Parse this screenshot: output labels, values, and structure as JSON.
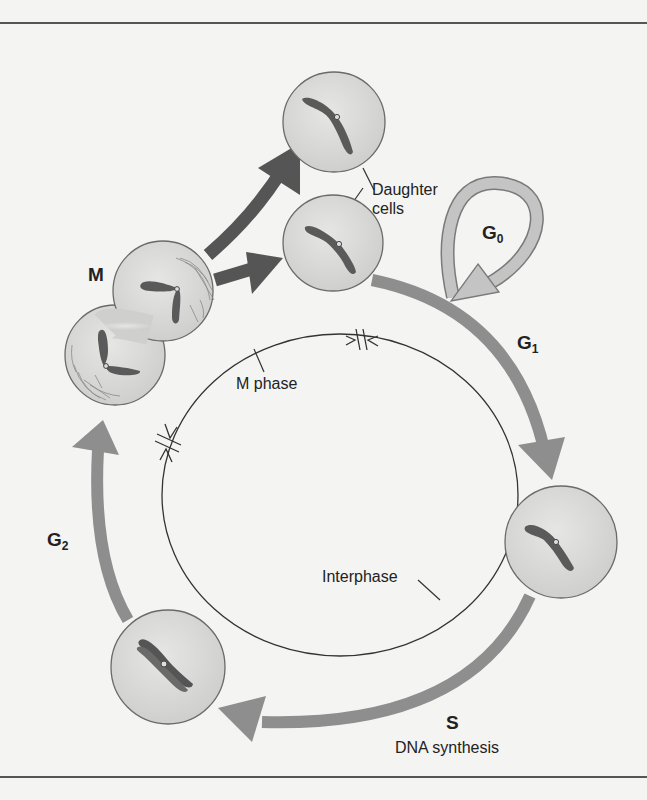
{
  "diagram": {
    "labels": {
      "daughter_cells_line1": "Daughter",
      "daughter_cells_line2": "cells",
      "m": "M",
      "g0_base": "G",
      "g0_sub": "0",
      "g1_base": "G",
      "g1_sub": "1",
      "g2_base": "G",
      "g2_sub": "2",
      "m_phase": "M phase",
      "interphase": "Interphase",
      "s": "S",
      "dna_synthesis": "DNA synthesis"
    },
    "colors": {
      "background": "#f4f4f2",
      "cycle_arrow": "#8e8e8e",
      "division_arrow": "#555555",
      "g0_arrow_fill": "#c4c4c4",
      "g0_arrow_stroke": "#7a7a7a",
      "cell_fill": "#d6d6d4",
      "cell_stroke": "#6a6a6a",
      "chromosome": "#5a5a5a",
      "rule": "#555555"
    }
  }
}
